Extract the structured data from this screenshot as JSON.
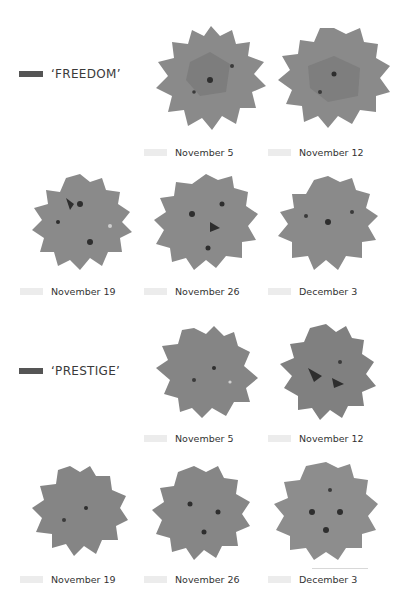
{
  "colors": {
    "background": "#ffffff",
    "legend_swatch": "#555555",
    "caption_chip": "#ececec",
    "plant_fill": "#8a8a8a",
    "plant_shade": "#6f6f6f",
    "plant_dark": "#2e2e2e"
  },
  "varieties": [
    {
      "name": "‘FREEDOM’",
      "photos": [
        {
          "date": "November 5"
        },
        {
          "date": "November 12"
        },
        {
          "date": "November 19"
        },
        {
          "date": "November 26"
        },
        {
          "date": "December 3"
        }
      ]
    },
    {
      "name": "‘PRESTIGE’",
      "photos": [
        {
          "date": "November 5"
        },
        {
          "date": "November 12"
        },
        {
          "date": "November 19"
        },
        {
          "date": "November 26"
        },
        {
          "date": "December 3"
        }
      ]
    }
  ]
}
